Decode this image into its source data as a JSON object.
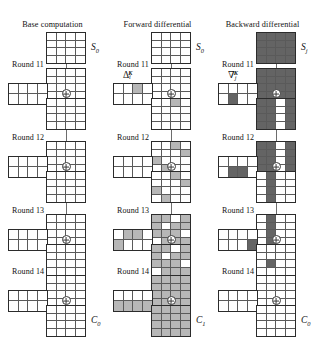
{
  "figure": {
    "colors": {
      "empty": "#ffffff",
      "light": "#b7b7b7",
      "dark": "#646464",
      "line": "#6d6d6d",
      "border": "#2b2b2b"
    },
    "legend_note": "white = inactive byte, light grey = forward-active byte, dark grey = backward-active byte"
  },
  "columns": [
    {
      "id": "base",
      "title": "Base computation",
      "top_label": "S",
      "top_label_sub": "0",
      "bottom_label": "C",
      "bottom_label_sub": "0",
      "key_symbol": null,
      "rounds": [
        {
          "name": "Round 11",
          "state_in": [
            "e",
            "e",
            "e",
            "e",
            "e",
            "e",
            "e",
            "e",
            "e",
            "e",
            "e",
            "e",
            "e",
            "e",
            "e",
            "e"
          ],
          "key": [
            "e",
            "e",
            "e",
            "e",
            "e",
            "e",
            "e",
            "e"
          ],
          "state_out": [
            "e",
            "e",
            "e",
            "e",
            "e",
            "e",
            "e",
            "e",
            "e",
            "e",
            "e",
            "e",
            "e",
            "e",
            "e",
            "e"
          ]
        },
        {
          "name": "Round 12",
          "state_in": [
            "e",
            "e",
            "e",
            "e",
            "e",
            "e",
            "e",
            "e",
            "e",
            "e",
            "e",
            "e",
            "e",
            "e",
            "e",
            "e"
          ],
          "key": [
            "e",
            "e",
            "e",
            "e",
            "e",
            "e",
            "e",
            "e"
          ],
          "state_out": [
            "e",
            "e",
            "e",
            "e",
            "e",
            "e",
            "e",
            "e",
            "e",
            "e",
            "e",
            "e",
            "e",
            "e",
            "e",
            "e"
          ]
        },
        {
          "name": "Round 13",
          "state_in": [
            "e",
            "e",
            "e",
            "e",
            "e",
            "e",
            "e",
            "e",
            "e",
            "e",
            "e",
            "e",
            "e",
            "e",
            "e",
            "e"
          ],
          "key": [
            "e",
            "e",
            "e",
            "e",
            "e",
            "e",
            "e",
            "e"
          ],
          "state_out": [
            "e",
            "e",
            "e",
            "e",
            "e",
            "e",
            "e",
            "e",
            "e",
            "e",
            "e",
            "e",
            "e",
            "e",
            "e",
            "e"
          ]
        },
        {
          "name": "Round 14",
          "state_in": [
            "e",
            "e",
            "e",
            "e",
            "e",
            "e",
            "e",
            "e",
            "e",
            "e",
            "e",
            "e",
            "e",
            "e",
            "e",
            "e"
          ],
          "key": [
            "e",
            "e",
            "e",
            "e",
            "e",
            "e",
            "e",
            "e"
          ],
          "state_out": [
            "e",
            "e",
            "e",
            "e",
            "e",
            "e",
            "e",
            "e",
            "e",
            "e",
            "e",
            "e",
            "e",
            "e",
            "e",
            "e"
          ]
        }
      ]
    },
    {
      "id": "forward",
      "title": "Forward differential",
      "top_label": "S",
      "top_label_sub": "0",
      "bottom_label": "C",
      "bottom_label_sub": "1",
      "key_symbol": {
        "glyph": "Δ",
        "sub": "i",
        "sup": "K"
      },
      "rounds": [
        {
          "name": "Round 11",
          "state_in": [
            "e",
            "e",
            "e",
            "e",
            "e",
            "e",
            "e",
            "e",
            "e",
            "e",
            "e",
            "e",
            "e",
            "e",
            "e",
            "e"
          ],
          "key": [
            "e",
            "e",
            "l",
            "e",
            "e",
            "e",
            "e",
            "e"
          ],
          "state_out": [
            "e",
            "e",
            "l",
            "e",
            "e",
            "e",
            "e",
            "e",
            "e",
            "e",
            "e",
            "e",
            "e",
            "e",
            "e",
            "e"
          ]
        },
        {
          "name": "Round 12",
          "state_in": [
            "e",
            "e",
            "l",
            "e",
            "e",
            "e",
            "e",
            "l",
            "l",
            "e",
            "e",
            "e",
            "e",
            "l",
            "e",
            "e"
          ],
          "key": [
            "e",
            "e",
            "e",
            "e",
            "e",
            "e",
            "e",
            "e"
          ],
          "state_out": [
            "e",
            "e",
            "l",
            "e",
            "e",
            "e",
            "e",
            "l",
            "l",
            "e",
            "e",
            "e",
            "e",
            "l",
            "e",
            "e"
          ]
        },
        {
          "name": "Round 13",
          "state_in": [
            "l",
            "l",
            "e",
            "l",
            "l",
            "e",
            "l",
            "l",
            "l",
            "l",
            "l",
            "e",
            "e",
            "l",
            "l",
            "l"
          ],
          "key": [
            "e",
            "l",
            "l",
            "e",
            "l",
            "e",
            "e",
            "e"
          ],
          "state_out": [
            "l",
            "l",
            "e",
            "l",
            "l",
            "e",
            "l",
            "l",
            "l",
            "l",
            "l",
            "e",
            "e",
            "l",
            "l",
            "l"
          ]
        },
        {
          "name": "Round 14",
          "state_in": [
            "l",
            "l",
            "l",
            "l",
            "l",
            "l",
            "l",
            "l",
            "l",
            "l",
            "l",
            "l",
            "l",
            "l",
            "l",
            "l"
          ],
          "key": [
            "e",
            "e",
            "e",
            "e",
            "l",
            "l",
            "l",
            "l"
          ],
          "state_out": [
            "l",
            "l",
            "l",
            "l",
            "l",
            "l",
            "l",
            "l",
            "l",
            "l",
            "l",
            "l",
            "l",
            "l",
            "l",
            "l"
          ]
        }
      ]
    },
    {
      "id": "backward",
      "title": "Backward differential",
      "top_label": "S",
      "top_label_sub": "j",
      "bottom_label": "C",
      "bottom_label_sub": "0",
      "key_symbol": {
        "glyph": "∇",
        "sub": "j",
        "sup": "K"
      },
      "rounds": [
        {
          "name": "Round 11",
          "state_in": [
            "d",
            "d",
            "d",
            "d",
            "d",
            "d",
            "d",
            "d",
            "d",
            "d",
            "d",
            "d",
            "d",
            "d",
            "d",
            "d"
          ],
          "key": [
            "e",
            "e",
            "e",
            "e",
            "e",
            "d",
            "e",
            "e"
          ],
          "state_out": [
            "d",
            "d",
            "e",
            "d",
            "d",
            "d",
            "e",
            "d",
            "d",
            "d",
            "e",
            "d",
            "d",
            "d",
            "e",
            "d"
          ]
        },
        {
          "name": "Round 12",
          "state_in": [
            "d",
            "d",
            "e",
            "d",
            "d",
            "d",
            "e",
            "d",
            "d",
            "d",
            "e",
            "d",
            "d",
            "d",
            "e",
            "d"
          ],
          "key": [
            "e",
            "e",
            "e",
            "e",
            "e",
            "d",
            "d",
            "e"
          ],
          "state_out": [
            "e",
            "d",
            "e",
            "e",
            "e",
            "d",
            "e",
            "e",
            "e",
            "d",
            "e",
            "e",
            "e",
            "d",
            "e",
            "e"
          ]
        },
        {
          "name": "Round 13",
          "state_in": [
            "e",
            "d",
            "e",
            "e",
            "e",
            "d",
            "e",
            "e",
            "e",
            "d",
            "e",
            "e",
            "e",
            "d",
            "e",
            "e"
          ],
          "key": [
            "e",
            "e",
            "e",
            "e",
            "e",
            "e",
            "e",
            "d"
          ],
          "state_out": [
            "e",
            "e",
            "e",
            "e",
            "e",
            "e",
            "e",
            "e",
            "e",
            "d",
            "e",
            "e",
            "e",
            "e",
            "e",
            "e"
          ]
        },
        {
          "name": "Round 14",
          "state_in": [
            "e",
            "e",
            "e",
            "e",
            "e",
            "e",
            "e",
            "e",
            "e",
            "e",
            "e",
            "e",
            "e",
            "e",
            "e",
            "e"
          ],
          "key": [
            "e",
            "e",
            "e",
            "e",
            "e",
            "e",
            "e",
            "e"
          ],
          "state_out": [
            "e",
            "e",
            "e",
            "e",
            "e",
            "e",
            "e",
            "e",
            "e",
            "e",
            "e",
            "e",
            "e",
            "e",
            "e",
            "e"
          ]
        }
      ]
    }
  ],
  "geometry": {
    "round_label_y": [
      60,
      133,
      206,
      267
    ],
    "state_in_y": [
      68,
      141,
      214,
      275
    ],
    "key_y": [
      83,
      156,
      229,
      290
    ],
    "xor_y": [
      89,
      162,
      235,
      296
    ],
    "state_out_y": [
      98,
      171,
      244,
      305
    ],
    "top_state_y": 32
  }
}
